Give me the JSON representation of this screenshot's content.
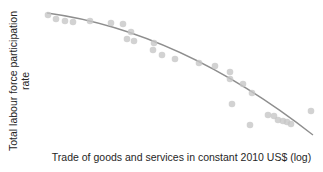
{
  "figure": {
    "ylabel_line1": "Total labour force participation",
    "ylabel_line2": "rate",
    "xlabel": "Trade of goods and services in constant 2010 US$ (log)"
  },
  "chart_data": {
    "type": "scatter",
    "title": "",
    "xlabel": "Trade of goods and services in constant 2010 US$ (log)",
    "ylabel": "Total labour force participation rate",
    "x_tick_labels": [],
    "y_tick_labels": [],
    "grid": false,
    "legend": false,
    "axes_lines_visible": false,
    "relationship": "negative, concave-down fitted curve: participation rate falls as log trade rises",
    "points_px": [
      [
        48,
        15
      ],
      [
        56,
        19
      ],
      [
        65,
        21
      ],
      [
        73,
        22
      ],
      [
        90,
        21
      ],
      [
        111,
        23
      ],
      [
        123,
        24
      ],
      [
        131,
        32
      ],
      [
        127,
        39
      ],
      [
        134,
        41
      ],
      [
        154,
        43
      ],
      [
        153,
        50
      ],
      [
        162,
        55
      ],
      [
        175,
        59
      ],
      [
        199,
        63
      ],
      [
        215,
        66
      ],
      [
        230,
        72
      ],
      [
        230,
        79
      ],
      [
        243,
        84
      ],
      [
        252,
        93
      ],
      [
        232,
        104
      ],
      [
        250,
        125
      ],
      [
        268,
        115
      ],
      [
        274,
        116
      ],
      [
        278,
        120
      ],
      [
        283,
        121
      ],
      [
        287,
        122
      ],
      [
        291,
        124
      ],
      [
        311,
        111
      ]
    ],
    "curve_px": {
      "start": [
        47,
        13
      ],
      "control": [
        180,
        31
      ],
      "end": [
        313,
        135
      ]
    },
    "style": {
      "dot_radius": 3.3,
      "dot_opacity": 0.8,
      "line_width": 1.3
    },
    "colors": {
      "dot": "#c7c7c7",
      "line": "#8e8e8e",
      "text": "#262626",
      "background": "#ffffff"
    }
  }
}
